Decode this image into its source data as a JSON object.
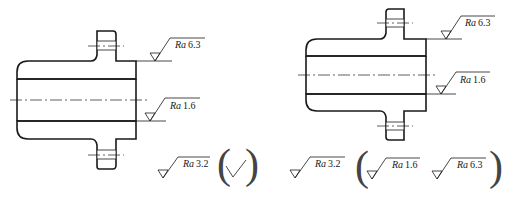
{
  "figure": {
    "left_part": {
      "roughness_labels": [
        {
          "param": "Ra",
          "value": "6.3"
        },
        {
          "param": "Ra",
          "value": "1.6"
        }
      ],
      "general_note": {
        "main": {
          "param": "Ra",
          "value": "3.2"
        },
        "others": "check-mark"
      }
    },
    "right_part": {
      "roughness_labels": [
        {
          "param": "Ra",
          "value": "6.3"
        },
        {
          "param": "Ra",
          "value": "1.6"
        }
      ],
      "general_note": {
        "main": {
          "param": "Ra",
          "value": "3.2"
        },
        "others": [
          {
            "param": "Ra",
            "value": "1.6"
          },
          {
            "param": "Ra",
            "value": "6.3"
          }
        ]
      }
    },
    "colors": {
      "line": "#1a1a1a",
      "background": "#ffffff"
    }
  }
}
